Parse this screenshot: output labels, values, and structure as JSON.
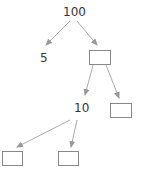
{
  "diagram": {
    "type": "factor-tree",
    "root": "100",
    "left_child": "5",
    "mid_node": "10",
    "edge_color": "#999999",
    "box_border_color": "#888888",
    "blanks": [
      "",
      "",
      "",
      ""
    ]
  }
}
